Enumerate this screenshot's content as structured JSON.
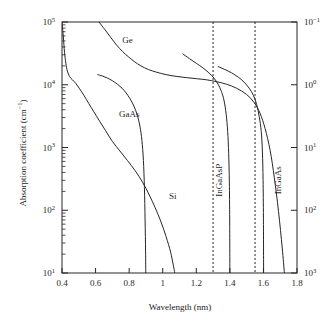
{
  "chart_data": {
    "type": "line",
    "title": "",
    "xlabel": "Wavelength (nm)",
    "ylabel": "Absorption coefficient (cm−1)",
    "ylabel_right": "",
    "xlim": [
      0.4,
      1.8
    ],
    "ylim": [
      10,
      100000
    ],
    "yscale": "log",
    "xticks": [
      0.4,
      0.6,
      0.8,
      1.0,
      1.2,
      1.4,
      1.6,
      1.8
    ],
    "xtick_labels": [
      "0.4",
      "0.6",
      "0.8",
      "1",
      "1.2",
      "1.4",
      "1.6",
      "1.8"
    ],
    "yticks": [
      10,
      100,
      1000,
      10000,
      100000
    ],
    "ytick_labels": [
      "10¹",
      "10²",
      "10³",
      "10⁴",
      "10⁵"
    ],
    "ytick_labels_right": [
      "10⁰¹",
      "10⁰",
      "10¹",
      "10²",
      "10³"
    ],
    "right_axis_ticks_top_to_bottom": [
      "10⁻¹",
      "10⁰",
      "10¹",
      "10²",
      "10³"
    ],
    "grid": false,
    "legend": "inline-annotations",
    "annotations": [
      {
        "text": "Ge",
        "x": 0.79,
        "y": 46000,
        "rotation": 0
      },
      {
        "text": "GaAs",
        "x": 0.8,
        "y": 3100,
        "rotation": 0
      },
      {
        "text": "Si",
        "x": 1.06,
        "y": 150,
        "rotation": 0
      },
      {
        "text": "InGaAsP",
        "x": 1.355,
        "y": 300,
        "rotation": -90
      },
      {
        "text": "InGaAs",
        "x": 1.705,
        "y": 300,
        "rotation": -90
      }
    ],
    "vlines": [
      {
        "x": 1.3,
        "style": "dashed"
      },
      {
        "x": 1.55,
        "style": "dashed"
      }
    ],
    "series": [
      {
        "name": "Si",
        "points": [
          [
            0.4,
            100000
          ],
          [
            0.408,
            58000
          ],
          [
            0.415,
            33000
          ],
          [
            0.423,
            22000
          ],
          [
            0.432,
            16500
          ],
          [
            0.445,
            13500
          ],
          [
            0.462,
            12000
          ],
          [
            0.482,
            10500
          ],
          [
            0.505,
            8600
          ],
          [
            0.53,
            6800
          ],
          [
            0.56,
            5000
          ],
          [
            0.59,
            3700
          ],
          [
            0.625,
            2600
          ],
          [
            0.66,
            1850
          ],
          [
            0.7,
            1250
          ],
          [
            0.745,
            880
          ],
          [
            0.79,
            620
          ],
          [
            0.835,
            430
          ],
          [
            0.88,
            280
          ],
          [
            0.92,
            175
          ],
          [
            0.955,
            110
          ],
          [
            0.99,
            65
          ],
          [
            1.02,
            38
          ],
          [
            1.048,
            21
          ],
          [
            1.072,
            10
          ]
        ]
      },
      {
        "name": "Ge",
        "points": [
          [
            0.62,
            100000
          ],
          [
            0.655,
            76000
          ],
          [
            0.69,
            57000
          ],
          [
            0.725,
            43000
          ],
          [
            0.76,
            34000
          ],
          [
            0.795,
            28000
          ],
          [
            0.83,
            23500
          ],
          [
            0.87,
            20000
          ],
          [
            0.915,
            17500
          ],
          [
            0.965,
            15800
          ],
          [
            1.02,
            14500
          ],
          [
            1.08,
            13600
          ],
          [
            1.14,
            13000
          ],
          [
            1.2,
            12500
          ],
          [
            1.26,
            12000
          ],
          [
            1.32,
            11200
          ],
          [
            1.38,
            10200
          ],
          [
            1.44,
            8800
          ],
          [
            1.5,
            7000
          ],
          [
            1.545,
            5200
          ],
          [
            1.58,
            3500
          ],
          [
            1.61,
            2000
          ],
          [
            1.64,
            900
          ],
          [
            1.665,
            330
          ],
          [
            1.69,
            95
          ],
          [
            1.712,
            25
          ],
          [
            1.725,
            10
          ]
        ]
      },
      {
        "name": "GaAs",
        "points": [
          [
            0.613,
            14500
          ],
          [
            0.64,
            13800
          ],
          [
            0.67,
            12800
          ],
          [
            0.7,
            11600
          ],
          [
            0.73,
            10200
          ],
          [
            0.758,
            8800
          ],
          [
            0.782,
            7400
          ],
          [
            0.805,
            6000
          ],
          [
            0.828,
            4600
          ],
          [
            0.848,
            3300
          ],
          [
            0.864,
            2200
          ],
          [
            0.876,
            1300
          ],
          [
            0.885,
            620
          ],
          [
            0.891,
            230
          ],
          [
            0.895,
            70
          ],
          [
            0.898,
            22
          ],
          [
            0.899,
            10
          ]
        ]
      },
      {
        "name": "InGaAsP",
        "points": [
          [
            1.12,
            31000
          ],
          [
            1.16,
            26000
          ],
          [
            1.2,
            22000
          ],
          [
            1.24,
            18500
          ],
          [
            1.275,
            15500
          ],
          [
            1.305,
            12800
          ],
          [
            1.33,
            10200
          ],
          [
            1.35,
            7800
          ],
          [
            1.366,
            5500
          ],
          [
            1.378,
            3400
          ],
          [
            1.387,
            1800
          ],
          [
            1.393,
            800
          ],
          [
            1.397,
            280
          ],
          [
            1.399,
            70
          ],
          [
            1.4,
            10
          ]
        ]
      },
      {
        "name": "InGaAs",
        "points": [
          [
            1.33,
            19500
          ],
          [
            1.37,
            17500
          ],
          [
            1.41,
            15500
          ],
          [
            1.45,
            13200
          ],
          [
            1.485,
            11000
          ],
          [
            1.515,
            8800
          ],
          [
            1.54,
            6800
          ],
          [
            1.56,
            4800
          ],
          [
            1.575,
            3100
          ],
          [
            1.587,
            1800
          ],
          [
            1.594,
            850
          ],
          [
            1.598,
            300
          ],
          [
            1.6,
            75
          ],
          [
            1.601,
            10
          ]
        ]
      }
    ]
  },
  "axes": {
    "left_title": "Absorption coefficient (cm",
    "left_title_sup": "−1",
    "left_title_close": ")",
    "bottom_title": "Wavelength (nm)"
  }
}
